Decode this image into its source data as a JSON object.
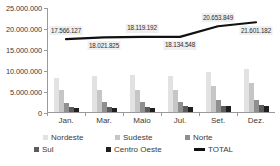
{
  "chart_data": {
    "type": "bar",
    "title": "",
    "subtitle": "",
    "xlabel": "",
    "ylabel": "",
    "categories": [
      "Jan.",
      "Mar.",
      "Maio",
      "Jul.",
      "Set.",
      "Dez."
    ],
    "ylim": [
      0,
      25000000
    ],
    "yticks": [
      0,
      5000000,
      10000000,
      15000000,
      20000000,
      25000000
    ],
    "ytick_labels": [
      "0",
      "5.000.000",
      "10.000.000",
      "15.000.000",
      "20.000.000",
      "25.000.000"
    ],
    "grid": false,
    "legend_position": "bottom",
    "series": [
      {
        "name": "Nordeste",
        "color": "#e2e2e2",
        "values": [
          8050000,
          8480000,
          8790000,
          8620000,
          9600000,
          10200000
        ]
      },
      {
        "name": "Sudeste",
        "color": "#c6c6c6",
        "values": [
          5150000,
          5180000,
          5250000,
          5300000,
          6270000,
          6800000
        ]
      },
      {
        "name": "Norte",
        "color": "#8f8f8f",
        "values": [
          2220000,
          2300000,
          2280000,
          2400000,
          2800000,
          2900000
        ]
      },
      {
        "name": "Sul",
        "color": "#5c5c5c",
        "values": [
          1300000,
          1300000,
          1300000,
          1320000,
          1480000,
          1620000
        ]
      },
      {
        "name": "Centro Oeste",
        "color": "#1f1f1f",
        "values": [
          1000000,
          1050000,
          1070000,
          1100000,
          1330000,
          1500000
        ]
      }
    ],
    "line_series": {
      "name": "TOTAL",
      "color": "#111111",
      "values": [
        17566127,
        18021825,
        18119192,
        18134548,
        20653849,
        21601182
      ],
      "labels": [
        "17.566.127",
        "18.021.825",
        "18.119.192",
        "18.134.548",
        "20.653.849",
        "21.601.182"
      ],
      "label_positions": [
        "above",
        "below",
        "above",
        "below",
        "above",
        "below"
      ]
    }
  },
  "legend": {
    "row1": [
      {
        "label": "Nordeste",
        "color": "#e2e2e2",
        "icon": "square-swatch-icon"
      },
      {
        "label": "Sudeste",
        "color": "#c6c6c6",
        "icon": "square-swatch-icon"
      },
      {
        "label": "Norte",
        "color": "#8f8f8f",
        "icon": "square-swatch-icon"
      }
    ],
    "row2": [
      {
        "label": "Sul",
        "color": "#5c5c5c",
        "icon": "square-swatch-icon"
      },
      {
        "label": "Centro Oeste",
        "color": "#1f1f1f",
        "icon": "square-swatch-icon"
      },
      {
        "label": "TOTAL",
        "color": "#111111",
        "icon": "line-swatch-icon"
      }
    ]
  }
}
